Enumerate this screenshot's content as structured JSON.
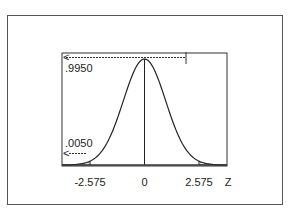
{
  "chart_data": {
    "type": "area",
    "title": "",
    "xlabel": "Z",
    "ylabel": "",
    "distribution": "standard normal",
    "xlim": [
      -3.9,
      3.9
    ],
    "x_ticks": [
      {
        "value": -2.575,
        "label": "-2.575"
      },
      {
        "value": 0,
        "label": "0"
      },
      {
        "value": 2.575,
        "label": "2.575"
      }
    ],
    "axis_label": "Z",
    "shaded_regions": [
      {
        "from": -3.9,
        "to": -2.575,
        "area": 0.005
      },
      {
        "from": 2.575,
        "to": 3.9,
        "area": 0.005
      }
    ],
    "vertical_lines": [
      -2.575,
      0,
      2.575
    ],
    "annotations": [
      {
        "text": ".9950",
        "meaning": "cumulative area to the left of 2.575",
        "arrow": "left"
      },
      {
        "text": ".0050",
        "meaning": "tail area to the left of -2.575",
        "arrow": "left"
      }
    ],
    "colors": {
      "line": "#222222",
      "shade": "#c8c8c8"
    }
  }
}
